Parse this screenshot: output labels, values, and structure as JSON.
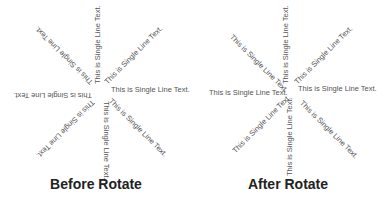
{
  "arm_text": "This is Single Line Text.",
  "panels": [
    {
      "caption": "Before Rotate",
      "arms": [
        {
          "label": "This is Single Line Text.",
          "angle": 0
        },
        {
          "label": "This is Single Line Text.",
          "angle": -45
        },
        {
          "label": "This is Single Line Text.",
          "angle": -90
        },
        {
          "label": "This is Single Line Text.",
          "angle": -135
        },
        {
          "label": "This is Single Line Text.",
          "angle": 180
        },
        {
          "label": "This is Single Line Text.",
          "angle": 135
        },
        {
          "label": "This is Single Line Text.",
          "angle": 90
        },
        {
          "label": "This is Single Line Text.",
          "angle": 45
        }
      ]
    },
    {
      "caption": "After Rotate",
      "arms": [
        {
          "label": "This is Single Line Text.",
          "angle": 0
        },
        {
          "label": "This is Single Line Text.",
          "angle": -45
        },
        {
          "label": "This is Single Line Text.",
          "angle": -90
        },
        {
          "label": "This is Single Line Text.",
          "angle": 45
        },
        {
          "label": "This is Single Line Text.",
          "angle": 0
        },
        {
          "label": "This is Single Line Text.",
          "angle": -45
        },
        {
          "label": "This is Single Line Text.",
          "angle": -90
        },
        {
          "label": "This is Single Line Text.",
          "angle": 45
        }
      ]
    }
  ],
  "colors": {
    "text": "#555555",
    "caption": "#222222",
    "background": "#ffffff"
  }
}
